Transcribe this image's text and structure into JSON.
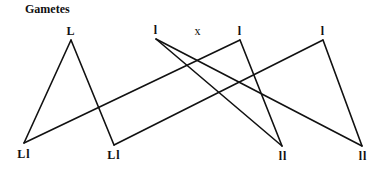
{
  "title": "Gametes",
  "cross_symbol": "x",
  "parents": [
    {
      "label": "L",
      "x": 71,
      "y": 40
    },
    {
      "label": "l",
      "x": 156,
      "y": 39
    },
    {
      "label": "l",
      "x": 240,
      "y": 40
    },
    {
      "label": "l",
      "x": 323,
      "y": 40
    }
  ],
  "offspring": [
    {
      "label": "Ll",
      "x": 24,
      "y": 143
    },
    {
      "label": "Ll",
      "x": 114,
      "y": 145
    },
    {
      "label": "ll",
      "x": 282,
      "y": 146
    },
    {
      "label": "ll",
      "x": 362,
      "y": 146
    }
  ],
  "connections": [
    {
      "from": 0,
      "to": 0
    },
    {
      "from": 0,
      "to": 1
    },
    {
      "from": 2,
      "to": 0
    },
    {
      "from": 3,
      "to": 1
    },
    {
      "from": 1,
      "to": 2
    },
    {
      "from": 1,
      "to": 3
    },
    {
      "from": 2,
      "to": 2
    },
    {
      "from": 3,
      "to": 3
    }
  ],
  "colors": {
    "line": "#111111",
    "background": "#ffffff"
  }
}
